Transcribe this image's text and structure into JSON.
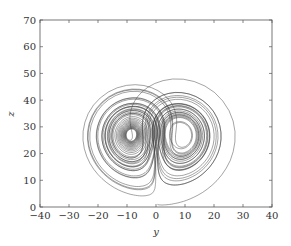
{
  "chart_data": {
    "type": "line",
    "title": "",
    "subtitle": "",
    "xlabel": "y",
    "ylabel": "z",
    "xlim": [
      -40,
      40
    ],
    "ylim": [
      0,
      70
    ],
    "xticks": [
      -40,
      -30,
      -20,
      -10,
      0,
      10,
      20,
      30,
      40
    ],
    "yticks": [
      0,
      10,
      20,
      30,
      40,
      50,
      60,
      70
    ],
    "grid": false,
    "legend": null,
    "series": [
      {
        "name": "trajectory",
        "color": "#3a3a3a",
        "parameters": {
          "sigma": 10,
          "rho": 28,
          "beta": 2.6667
        },
        "lobe_centers": [
          [
            -8.5,
            27
          ],
          [
            8.5,
            27
          ]
        ],
        "approx_extent": {
          "y_min": -32,
          "y_max": 30,
          "z_min": 1,
          "z_max": 62
        },
        "sample_points": [
          [
            0,
            1
          ],
          [
            2,
            3
          ],
          [
            8,
            8
          ],
          [
            20,
            20
          ],
          [
            27,
            35
          ],
          [
            28,
            48
          ],
          [
            18,
            60
          ],
          [
            0,
            62
          ],
          [
            -18,
            59
          ],
          [
            -28,
            50
          ],
          [
            -32,
            39
          ],
          [
            -26,
            33
          ],
          [
            -18,
            32
          ],
          [
            -12,
            28
          ],
          [
            -9,
            25
          ],
          [
            -7,
            27
          ],
          [
            -9,
            29
          ],
          [
            -10,
            27
          ],
          [
            0,
            25
          ],
          [
            8,
            26
          ],
          [
            10,
            28
          ],
          [
            8,
            30
          ],
          [
            6,
            27
          ]
        ]
      }
    ]
  }
}
